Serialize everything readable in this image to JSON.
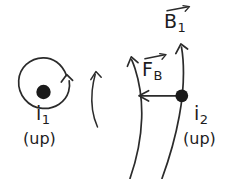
{
  "figure": {
    "background_color": "#ffffff",
    "ink_color": "#2b2b2b",
    "width": 226,
    "height": 179
  },
  "labels": {
    "current_one": {
      "symbol": "i",
      "subscript": "1",
      "direction": "(up)"
    },
    "current_two": {
      "symbol": "i",
      "subscript": "2",
      "direction": "(up)"
    },
    "field_vector": {
      "symbol": "B",
      "subscript": "1",
      "vector": true
    },
    "force_vector": {
      "symbol": "F",
      "subscript": "B",
      "vector": true
    }
  },
  "elements": {
    "wire_one_dot": "current-out-of-page-dot",
    "wire_two_dot": "current-out-of-page-dot",
    "field_circle": "circular-field-line-counterclockwise",
    "field_arc_near": "curved-field-line-arrow-up",
    "field_arc_far": "curved-field-line-arrow-up",
    "connector_arc": "curved-arrow-up",
    "force_arrow": "straight-arrow-left"
  }
}
